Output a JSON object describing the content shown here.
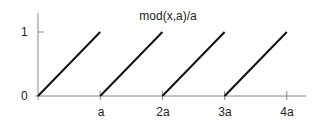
{
  "chart_data": {
    "type": "line",
    "title": "mod(x,a)/a",
    "xlabel": "",
    "ylabel": "",
    "x_tick_labels": [
      "a",
      "2a",
      "3a",
      "4a"
    ],
    "y_tick_labels": [
      "0",
      "1"
    ],
    "xlim": [
      0,
      4.3
    ],
    "ylim": [
      0,
      1.3
    ],
    "grid": false,
    "legend": null,
    "series": [
      {
        "name": "segment-1",
        "x": [
          0,
          1
        ],
        "y": [
          0,
          1
        ]
      },
      {
        "name": "segment-2",
        "x": [
          1,
          2
        ],
        "y": [
          0,
          1
        ]
      },
      {
        "name": "segment-3",
        "x": [
          2,
          3
        ],
        "y": [
          0,
          1
        ]
      },
      {
        "name": "segment-4",
        "x": [
          3,
          4
        ],
        "y": [
          0,
          1
        ]
      }
    ]
  },
  "colors": {
    "line": "#111111",
    "axis": "#888888",
    "text": "#222222"
  }
}
